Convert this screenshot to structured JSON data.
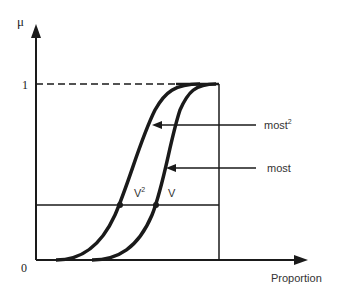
{
  "diagram": {
    "type": "fuzzy-membership-functions",
    "y_axis": {
      "label": "μ",
      "ticks": [
        "1",
        "0"
      ]
    },
    "x_axis": {
      "label": "Proportion"
    },
    "curves": [
      {
        "name": "most²",
        "label_base": "most",
        "label_sup": "2",
        "intersection_label_base": "V",
        "intersection_label_sup": "2"
      },
      {
        "name": "most",
        "label_base": "most",
        "intersection_label_base": "V"
      }
    ],
    "colors": {
      "ink": "#1a1a1a",
      "background": "#ffffff"
    }
  }
}
